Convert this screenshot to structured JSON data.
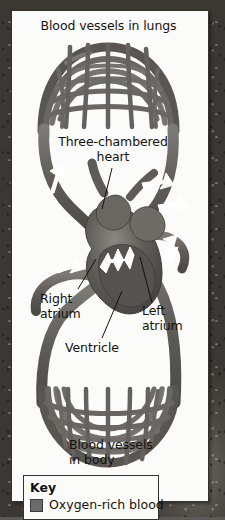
{
  "labels": {
    "lungs": "Blood vessels in lungs",
    "heart": "Three-chambered\nheart",
    "right_atrium": "Right\natrium",
    "left_atrium": "Left\natrium",
    "ventricle": "Ventricle",
    "body": "Blood vessels\nin body"
  },
  "key": {
    "title": "Key",
    "items": [
      {
        "label": "Oxygen-rich blood",
        "color": "#6b6b6b"
      }
    ]
  },
  "colors": {
    "panel_background": "#fbfbf9",
    "panel_border": "#35322e",
    "vessel_dark": "#55514d",
    "vessel_mid": "#6d6965",
    "vessel_light": "#8b8782",
    "heart_fill": "#5d5955",
    "arrow_fill": "#ffffff",
    "text": "#14120f",
    "backdrop": "#5a5a58"
  },
  "flow_arrows": [
    {
      "name": "left-vessel-up",
      "direction": "up"
    },
    {
      "name": "lung-return-right",
      "direction": "right"
    },
    {
      "name": "right-vessel-down",
      "direction": "down"
    },
    {
      "name": "body-return-left",
      "direction": "left"
    },
    {
      "name": "ventricle-out",
      "direction": "up"
    }
  ]
}
